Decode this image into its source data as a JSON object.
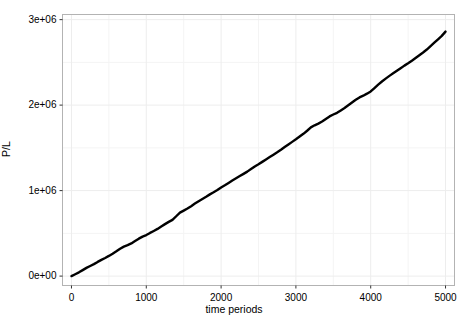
{
  "chart_data": {
    "type": "line",
    "title": "",
    "xlabel": "time periods",
    "ylabel": "P/L",
    "xlim": [
      -120,
      5120
    ],
    "ylim": [
      -110000,
      3060000
    ],
    "xticks": [
      0,
      1000,
      2000,
      3000,
      4000,
      5000
    ],
    "xticklabels": [
      "0",
      "1000",
      "2000",
      "3000",
      "4000",
      "5000"
    ],
    "yticks": [
      0,
      1000000,
      2000000,
      3000000
    ],
    "yticklabels": [
      "0e+00",
      "1e+06",
      "2e+06",
      "3e+06"
    ],
    "grid": true,
    "grid_minor": true,
    "legend": null,
    "line_color": "#000000",
    "line_width": 2.4,
    "panel_border_color": "#b3b3b3",
    "panel_background": "#ffffff",
    "grid_color": "#f0f0f0",
    "series": [
      {
        "name": "cumulative P/L",
        "x": [
          0,
          50,
          100,
          150,
          200,
          250,
          300,
          350,
          400,
          450,
          500,
          550,
          600,
          650,
          700,
          750,
          800,
          850,
          900,
          950,
          1000,
          1050,
          1100,
          1150,
          1200,
          1250,
          1300,
          1350,
          1400,
          1450,
          1500,
          1550,
          1600,
          1650,
          1700,
          1750,
          1800,
          1850,
          1900,
          1950,
          2000,
          2050,
          2100,
          2150,
          2200,
          2250,
          2300,
          2350,
          2400,
          2450,
          2500,
          2550,
          2600,
          2650,
          2700,
          2750,
          2800,
          2850,
          2900,
          2950,
          3000,
          3050,
          3100,
          3150,
          3200,
          3250,
          3300,
          3350,
          3400,
          3450,
          3500,
          3550,
          3600,
          3650,
          3700,
          3750,
          3800,
          3850,
          3900,
          3950,
          4000,
          4050,
          4100,
          4150,
          4200,
          4250,
          4300,
          4350,
          4400,
          4450,
          4500,
          4550,
          4600,
          4650,
          4700,
          4750,
          4800,
          4850,
          4900,
          4950,
          5000
        ],
        "y": [
          0,
          22000,
          44000,
          70000,
          96000,
          118000,
          140000,
          166000,
          190000,
          212000,
          236000,
          262000,
          290000,
          320000,
          345000,
          362000,
          382000,
          410000,
          438000,
          462000,
          480000,
          505000,
          528000,
          552000,
          580000,
          608000,
          634000,
          658000,
          700000,
          742000,
          766000,
          790000,
          818000,
          848000,
          876000,
          902000,
          928000,
          956000,
          980000,
          1006000,
          1036000,
          1062000,
          1090000,
          1118000,
          1144000,
          1170000,
          1196000,
          1222000,
          1252000,
          1282000,
          1308000,
          1336000,
          1364000,
          1392000,
          1420000,
          1448000,
          1478000,
          1510000,
          1540000,
          1570000,
          1600000,
          1632000,
          1664000,
          1700000,
          1740000,
          1764000,
          1784000,
          1808000,
          1838000,
          1868000,
          1890000,
          1910000,
          1938000,
          1966000,
          1998000,
          2030000,
          2062000,
          2090000,
          2110000,
          2134000,
          2160000,
          2200000,
          2240000,
          2276000,
          2310000,
          2342000,
          2372000,
          2402000,
          2432000,
          2462000,
          2490000,
          2520000,
          2552000,
          2584000,
          2616000,
          2650000,
          2690000,
          2730000,
          2770000,
          2810000,
          2860000
        ]
      }
    ]
  },
  "axes": {
    "x_title": "time periods",
    "y_title": "P/L"
  }
}
